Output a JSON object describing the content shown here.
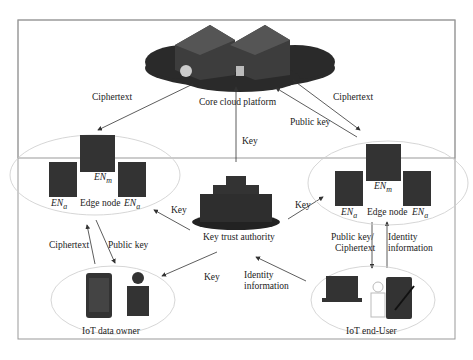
{
  "diagram": {
    "nodes": {
      "cloud": {
        "label": "Core cloud platform"
      },
      "kta": {
        "label": "Key trust authority"
      },
      "edge_left": {
        "label": "Edge node",
        "en_m": "EN",
        "en_m_sub": "m",
        "en_a1": "EN",
        "en_a1_sub": "a",
        "en_a2": "EN",
        "en_a2_sub": "a"
      },
      "edge_right": {
        "label": "Edge node",
        "en_m": "EN",
        "en_m_sub": "m",
        "en_a1": "EN",
        "en_a1_sub": "a",
        "en_a2": "EN",
        "en_a2_sub": "a"
      },
      "owner": {
        "label": "IoT data owner"
      },
      "enduser": {
        "label": "IoT end-User"
      }
    },
    "edges": {
      "cloud_to_left": "Ciphertext",
      "right_to_cloud_cipher": "Ciphertext",
      "right_to_cloud_pub": "Public key",
      "kta_to_cloud": "Key",
      "kta_to_left": "Key",
      "kta_to_right": "Key",
      "owner_to_left": "Ciphertext",
      "left_to_owner": "Public key",
      "kta_to_owner": "Key",
      "user_to_kta": "Identity information",
      "user_to_kta_l1": "Identity",
      "user_to_kta_l2": "information",
      "right_to_user_l1": "Public key/",
      "right_to_user_l2": "Ciphertext",
      "user_to_right_l1": "Identity",
      "user_to_right_l2": "information"
    }
  }
}
